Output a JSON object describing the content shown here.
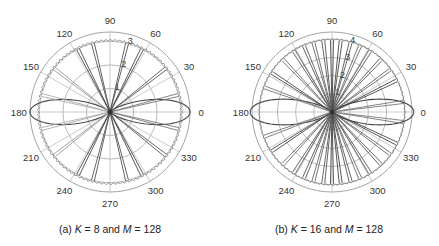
{
  "chart_data": [
    {
      "type": "polar",
      "panel": "a",
      "caption": {
        "prefix": "(a) ",
        "var1": "K",
        "mid": " = 8 and ",
        "var2": "M",
        "suffix": " = 128"
      },
      "K": 8,
      "M": 128,
      "center": [
        110,
        112
      ],
      "radius_px": 80,
      "r_max": 3.4,
      "radial_ticks": [
        1,
        2,
        3
      ],
      "angle_ticks": [
        0,
        30,
        60,
        90,
        120,
        150,
        180,
        210,
        240,
        270,
        300,
        330
      ],
      "beam_angles_deg": [
        14,
        38,
        63,
        76,
        104,
        117,
        142,
        166
      ],
      "beam_colors": [
        "#777",
        "#555",
        "#444",
        "#555",
        "#555",
        "#444",
        "#999",
        "#aaa"
      ],
      "beam_length": 3.0,
      "lobe_peak": 3.4,
      "lobe_width": 0.55,
      "envelope_r": 3.05,
      "grid": true
    },
    {
      "type": "polar",
      "panel": "b",
      "caption": {
        "prefix": "(b) ",
        "var1": "K",
        "mid": " = 16 and ",
        "var2": "M",
        "suffix": " = 128"
      },
      "K": 16,
      "M": 128,
      "center": [
        113,
        112
      ],
      "radius_px": 80,
      "r_max": 4.4,
      "radial_ticks": [
        1,
        2,
        3,
        4
      ],
      "angle_ticks": [
        0,
        30,
        60,
        90,
        120,
        150,
        180,
        210,
        240,
        270,
        300,
        330
      ],
      "beam_angles_deg": [
        8,
        26,
        36,
        47,
        58,
        67,
        75,
        83,
        90,
        97,
        105,
        113,
        122,
        133,
        147,
        160
      ],
      "beam_colors": [
        "#777",
        "#444",
        "#666",
        "#555",
        "#555",
        "#666",
        "#555",
        "#444",
        "#444",
        "#555",
        "#666",
        "#555",
        "#555",
        "#666",
        "#444",
        "#777"
      ],
      "beam_length": 3.95,
      "lobe_peak": 4.5,
      "lobe_width": 0.55,
      "envelope_r": 4.0,
      "grid": true
    }
  ]
}
